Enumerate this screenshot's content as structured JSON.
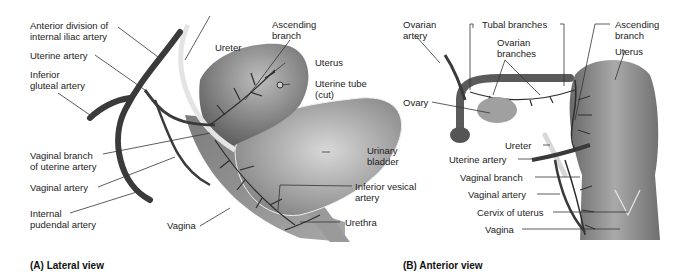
{
  "panel_a": {
    "caption": "(A) Lateral view",
    "labels": {
      "anterior_division": "Anterior division of\ninternal iliac artery",
      "uterine_artery": "Uterine artery",
      "inferior_gluteal": "Inferior\ngluteal artery",
      "vaginal_branch": "Vaginal branch\nof uterine artery",
      "vaginal_artery": "Vaginal artery",
      "internal_pudendal": "Internal\npudendal artery",
      "vagina": "Vagina",
      "ureter": "Ureter",
      "ascending_branch": "Ascending\nbranch",
      "uterus": "Uterus",
      "uterine_tube": "Uterine tube\n(cut)",
      "urinary_bladder": "Urinary\nbladder",
      "inferior_vesical": "Inferior vesical\nartery",
      "urethra": "Urethra"
    }
  },
  "panel_b": {
    "caption": "(B) Anterior view",
    "labels": {
      "ovarian_artery": "Ovarian\nartery",
      "tubal_branches": "Tubal branches",
      "ovarian_branches": "Ovarian\nbranches",
      "ascending_branch": "Ascending\nbranch",
      "uterus": "Uterus",
      "ovary": "Ovary",
      "ureter": "Ureter",
      "uterine_artery": "Uterine artery",
      "vaginal_branch": "Vaginal branch",
      "vaginal_artery": "Vaginal artery",
      "cervix": "Cervix of uterus",
      "vagina": "Vagina"
    }
  },
  "colors": {
    "artery": "#3a3a3a",
    "organ_dark": "#6e6e6e",
    "organ_light": "#bdbdbd",
    "leader": "#333333",
    "ureter": "#e0e0e0"
  }
}
